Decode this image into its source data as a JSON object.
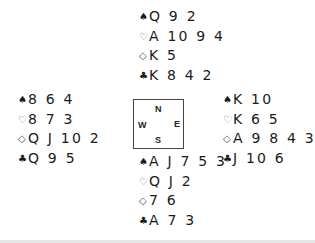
{
  "deal": {
    "north": {
      "spades": {
        "symbol": "♠",
        "cards": "Q 9 2"
      },
      "hearts": {
        "symbol": "♡",
        "cards": "A 10 9 4"
      },
      "diamonds": {
        "symbol": "◇",
        "cards": "K 5"
      },
      "clubs": {
        "symbol": "♣",
        "cards": "K 8 4 2"
      }
    },
    "west": {
      "spades": {
        "symbol": "♠",
        "cards": "8 6 4"
      },
      "hearts": {
        "symbol": "♡",
        "cards": "8 7 3"
      },
      "diamonds": {
        "symbol": "◇",
        "cards": "Q J 10 2"
      },
      "clubs": {
        "symbol": "♣",
        "cards": "Q 9 5"
      }
    },
    "east": {
      "spades": {
        "symbol": "♠",
        "cards": "K 10"
      },
      "hearts": {
        "symbol": "♡",
        "cards": "K 6 5"
      },
      "diamonds": {
        "symbol": "◇",
        "cards": "A 9 8 4 3"
      },
      "clubs": {
        "symbol": "♣",
        "cards": "J 10 6"
      }
    },
    "south": {
      "spades": {
        "symbol": "♠",
        "cards": "A J 7 5 3"
      },
      "hearts": {
        "symbol": "♡",
        "cards": "Q J 2"
      },
      "diamonds": {
        "symbol": "◇",
        "cards": "7 6"
      },
      "clubs": {
        "symbol": "♣",
        "cards": "A 7 3"
      }
    }
  },
  "compass": {
    "n": "N",
    "s": "S",
    "w": "W",
    "e": "E"
  }
}
